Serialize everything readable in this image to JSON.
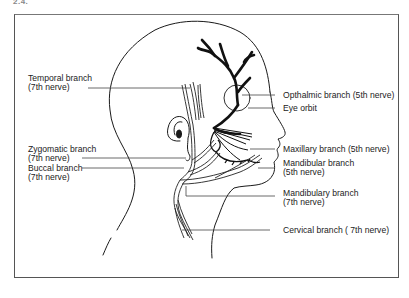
{
  "figure": {
    "number_fragment": "2.4."
  },
  "labels_left": [
    {
      "id": "temporal",
      "line1": "Temporal branch",
      "line2": "(7th nerve)"
    },
    {
      "id": "zygomatic",
      "line1": "Zygomatic branch",
      "line2": "(7th nerve)"
    },
    {
      "id": "buccal",
      "line1": "Buccal branch",
      "line2": "(7th nerve)"
    }
  ],
  "labels_right": [
    {
      "id": "opthalmic",
      "line1": "Opthalmic branch (5th nerve)",
      "line2": ""
    },
    {
      "id": "eye-orbit",
      "line1": "Eye orbit",
      "line2": ""
    },
    {
      "id": "maxillary",
      "line1": "Maxillary branch (5th nerve)",
      "line2": ""
    },
    {
      "id": "mandibular",
      "line1": "Mandibular branch",
      "line2": "(5th nerve)"
    },
    {
      "id": "mandibulary",
      "line1": "Mandibulary branch",
      "line2": "(7th nerve)"
    },
    {
      "id": "cervical",
      "line1": "Cervical branch ( 7th nerve)",
      "line2": ""
    }
  ],
  "colors": {
    "ink": "#1a1a1a",
    "leader": "#444444",
    "frame": "#555555",
    "background": "#ffffff"
  }
}
